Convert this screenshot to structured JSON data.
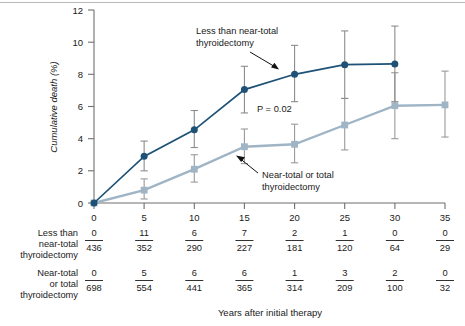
{
  "chart_data": {
    "type": "line",
    "title": "",
    "xlabel": "Years after initial therapy",
    "ylabel": "Cumulative death (%)",
    "xlim": [
      0,
      35
    ],
    "ylim": [
      0,
      12
    ],
    "xticks": [
      "0",
      "5",
      "10",
      "15",
      "20",
      "25",
      "30",
      "35"
    ],
    "yticks": [
      "0",
      "2",
      "4",
      "6",
      "8",
      "10",
      "12"
    ],
    "grid": false,
    "legend_position": "inline-annotations",
    "annotations": [
      {
        "name": "p-value",
        "text": "P = 0.02"
      },
      {
        "name": "series-1-callout",
        "line1": "Less than near-total",
        "line2": "thyroidectomy"
      },
      {
        "name": "series-2-callout",
        "line1": "Near-total or total",
        "line2": "thyroidectomy"
      }
    ],
    "series": [
      {
        "name": "Less than near-total thyroidectomy",
        "color": "#1d5276",
        "marker": "circle",
        "x": [
          0,
          5,
          10,
          15,
          20,
          25,
          30
        ],
        "values": [
          0,
          2.9,
          4.55,
          7.05,
          8.0,
          8.6,
          8.65
        ],
        "err_low": [
          0,
          2.0,
          3.45,
          5.6,
          6.3,
          6.5,
          6.3
        ],
        "err_high": [
          0,
          3.85,
          5.75,
          8.5,
          9.8,
          10.7,
          11.0
        ]
      },
      {
        "name": "Near-total or total thyroidectomy",
        "color": "#9fb4c5",
        "marker": "square",
        "x": [
          0,
          5,
          10,
          15,
          20,
          25,
          30,
          35
        ],
        "values": [
          0,
          0.8,
          2.1,
          3.5,
          3.65,
          4.85,
          6.05,
          6.1
        ],
        "err_low": [
          0,
          0.25,
          1.3,
          2.45,
          2.5,
          3.3,
          4.0,
          4.1
        ],
        "err_high": [
          0,
          1.5,
          3.0,
          4.6,
          4.9,
          6.5,
          8.1,
          8.2
        ]
      }
    ]
  },
  "risk_table": {
    "column_x": [
      "0",
      "5",
      "10",
      "15",
      "20",
      "25",
      "30",
      "35"
    ],
    "rows": [
      {
        "label_lines": [
          "Less than",
          "near-total",
          "thyroidectomy"
        ],
        "numerators": [
          "0",
          "11",
          "6",
          "7",
          "2",
          "1",
          "0",
          "0"
        ],
        "denominators": [
          "436",
          "352",
          "290",
          "227",
          "181",
          "120",
          "64",
          "29"
        ]
      },
      {
        "label_lines": [
          "Near-total",
          "or total",
          "thyroidectomy"
        ],
        "numerators": [
          "0",
          "5",
          "6",
          "6",
          "1",
          "3",
          "2",
          "0"
        ],
        "denominators": [
          "698",
          "554",
          "441",
          "365",
          "314",
          "209",
          "100",
          "32"
        ]
      }
    ]
  },
  "colors": {
    "series_dark": "#1d5276",
    "series_light": "#9fb4c5",
    "axis": "#6f6f6f",
    "errorbar_dark": "#8c8c8c",
    "errorbar_light": "#9a9a9a",
    "top_rule": "#b9b9b9"
  }
}
